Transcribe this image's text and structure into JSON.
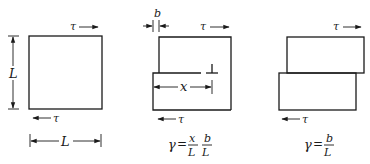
{
  "figure": {
    "panels": [
      {
        "id": "undeformed",
        "labels": {
          "tau_top": "τ",
          "tau_bottom": "τ",
          "height": "L",
          "width": "L"
        }
      },
      {
        "id": "partial-slip",
        "labels": {
          "offset": "b",
          "tau_top": "τ",
          "tau_bottom": "τ",
          "slip_distance": "x",
          "dislocation_symbol": "⊥"
        },
        "formula": {
          "lhs": "γ",
          "eq": "=",
          "frac1_num": "x",
          "frac1_den": "L",
          "frac2_num": "b",
          "frac2_den": "L"
        }
      },
      {
        "id": "full-slip",
        "labels": {
          "tau_top": "τ",
          "tau_bottom": "τ"
        },
        "formula": {
          "lhs": "γ",
          "eq": "=",
          "frac_num": "b",
          "frac_den": "L"
        }
      }
    ]
  }
}
